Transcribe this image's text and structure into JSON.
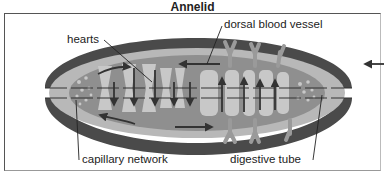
{
  "title": "Annelid",
  "labels": {
    "dorsal_blood_vessel": "dorsal blood vessel",
    "hearts": "hearts",
    "capillary_network": "capillary network",
    "digestive_tube": "digestive tube"
  },
  "colors": {
    "outer_body": "#4a4a4a",
    "mid_layer": "#b8b8b8",
    "inner_cavity": "#8f8f8f",
    "organs": "#c8c8c8",
    "arrows": "#333333",
    "frame": "#555555"
  }
}
